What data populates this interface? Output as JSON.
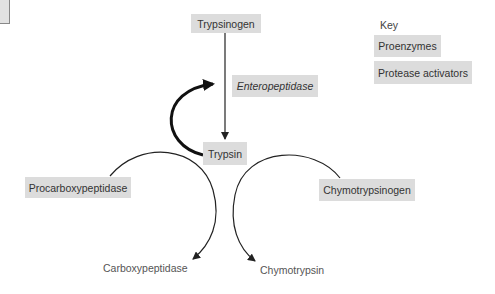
{
  "diagram": {
    "title_visible": false,
    "nodes": {
      "trypsinogen": "Trypsinogen",
      "enteropeptidase": "Enteropeptidase",
      "trypsin": "Trypsin",
      "procarboxypeptidase": "Procarboxypeptidase",
      "chymotrypsinogen": "Chymotrypsinogen",
      "carboxypeptidase": "Carboxypeptidase",
      "chymotrypsin": "Chymotrypsin"
    },
    "edges": [
      {
        "from": "Trypsinogen",
        "to": "Trypsin",
        "label": "Enteropeptidase"
      },
      {
        "from": "Trypsin",
        "to": "Trypsinogen",
        "style": "thick",
        "note": "autoactivation loop"
      },
      {
        "from": "Procarboxypeptidase",
        "to": "Carboxypeptidase",
        "via": "Trypsin"
      },
      {
        "from": "Chymotrypsinogen",
        "to": "Chymotrypsin",
        "via": "Trypsin"
      }
    ],
    "key": {
      "title": "Key",
      "items": [
        "Proenzymes",
        "Protease activators"
      ]
    },
    "colors": {
      "box_fill": "#dcdcdc",
      "line": "#222222",
      "text": "#333333"
    }
  }
}
